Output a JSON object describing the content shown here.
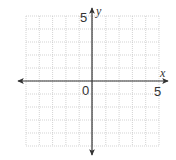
{
  "diagram": {
    "type": "coordinate-plane",
    "x_range": [
      -5,
      5
    ],
    "y_range": [
      -5,
      5
    ],
    "grid_step": 1,
    "labels": {
      "x_axis": "x",
      "y_axis": "y",
      "origin": "0",
      "x_max": "5",
      "y_max": "5"
    },
    "colors": {
      "axis": "#333333",
      "grid": "#c8c8c8",
      "background": "#ffffff"
    }
  }
}
